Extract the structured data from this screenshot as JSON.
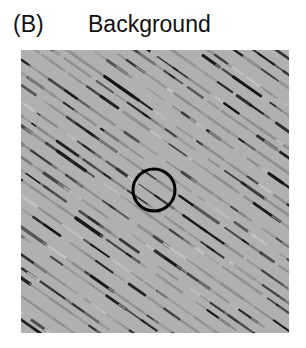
{
  "figure": {
    "panel_letter": "(B)",
    "panel_title": "Background",
    "background_color": "#ffffff"
  },
  "stimulus": {
    "name": "oriented-line-texture",
    "base_color": "#b0b0b0",
    "dark_element_color": "#151515",
    "mid_element_color": "#8e8e8e",
    "light_element_color": "#c4c4c4",
    "element_orientation_deg": 35,
    "element_count": 520,
    "x": 21,
    "y": 50,
    "width": 268,
    "height": 283
  },
  "target_marker": {
    "name": "circle-outline",
    "stroke_color": "#000000",
    "stroke_width": 3,
    "center_x": 133,
    "center_y": 140,
    "radius": 21
  }
}
